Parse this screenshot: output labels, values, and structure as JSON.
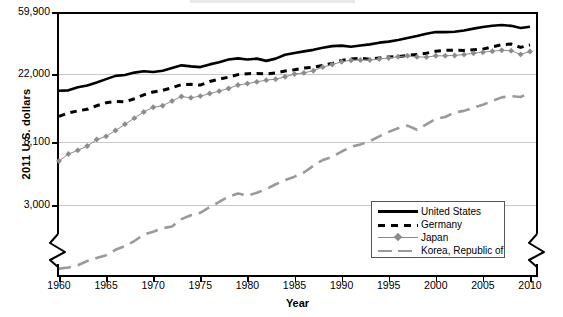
{
  "chart_data": {
    "type": "line",
    "title": "",
    "xlabel": "Year",
    "ylabel": "2011 U.S. dollars",
    "yscale": "log",
    "ylim": [
      1000,
      59900
    ],
    "xlim": [
      1960,
      2010
    ],
    "grid": true,
    "axis_break": true,
    "legend_position": "bottom-right",
    "ytick_labels": [
      "59,900",
      "22,000",
      "8,100",
      "3,000"
    ],
    "ytick_values": [
      59900,
      22000,
      8100,
      3000
    ],
    "xtick_labels": [
      "1960",
      "1965",
      "1970",
      "1975",
      "1980",
      "1985",
      "1990",
      "1995",
      "2000",
      "2005",
      "2010"
    ],
    "xtick_values": [
      1960,
      1965,
      1970,
      1975,
      1980,
      1985,
      1990,
      1995,
      2000,
      2005,
      2010
    ],
    "x": [
      1960,
      1961,
      1962,
      1963,
      1964,
      1965,
      1966,
      1967,
      1968,
      1969,
      1970,
      1971,
      1972,
      1973,
      1974,
      1975,
      1976,
      1977,
      1978,
      1979,
      1980,
      1981,
      1982,
      1983,
      1984,
      1985,
      1986,
      1987,
      1988,
      1989,
      1990,
      1991,
      1992,
      1993,
      1994,
      1995,
      1996,
      1997,
      1998,
      1999,
      2000,
      2001,
      2002,
      2003,
      2004,
      2005,
      2006,
      2007,
      2008,
      2009,
      2010
    ],
    "series": [
      {
        "name": "United States",
        "color": "#000000",
        "style": "solid",
        "marker": "none",
        "values": [
          17200,
          17300,
          18100,
          18600,
          19400,
          20400,
          21400,
          21700,
          22500,
          23000,
          22700,
          23200,
          24200,
          25300,
          24900,
          24600,
          25700,
          26600,
          27800,
          28300,
          27800,
          28200,
          27200,
          28200,
          30000,
          30900,
          31700,
          32500,
          33600,
          34500,
          34800,
          34200,
          34900,
          35500,
          36500,
          37100,
          38100,
          39300,
          40600,
          42100,
          43300,
          43300,
          43500,
          44400,
          45800,
          47000,
          48000,
          48500,
          47900,
          46300,
          47200
        ]
      },
      {
        "name": "Germany",
        "color": "#000000",
        "style": "dashed",
        "marker": "none",
        "values": [
          11800,
          12400,
          12800,
          13100,
          13800,
          14400,
          14700,
          14600,
          15300,
          16200,
          16900,
          17300,
          18000,
          18800,
          18900,
          18700,
          19700,
          20400,
          21000,
          21800,
          22100,
          22200,
          22000,
          22400,
          23100,
          23600,
          24200,
          24500,
          25300,
          26100,
          27400,
          28000,
          28400,
          27900,
          28500,
          29000,
          29200,
          29700,
          30200,
          30800,
          31800,
          32300,
          32300,
          32200,
          32600,
          32900,
          34100,
          35300,
          35700,
          33800,
          35200
        ]
      },
      {
        "name": "Japan",
        "color": "#8c8c8c",
        "style": "solid",
        "marker": "diamond",
        "values": [
          6000,
          6700,
          7100,
          7600,
          8400,
          8800,
          9600,
          10500,
          11500,
          12600,
          13500,
          13800,
          14800,
          15800,
          15500,
          15900,
          16500,
          17100,
          17800,
          18700,
          19100,
          19600,
          20100,
          20400,
          21100,
          22000,
          22400,
          23200,
          24600,
          25600,
          26800,
          27500,
          27600,
          27600,
          28000,
          28500,
          29100,
          29500,
          29000,
          28900,
          29500,
          29500,
          29700,
          30100,
          30800,
          31300,
          31800,
          32300,
          32000,
          30200,
          31600
        ]
      },
      {
        "name": "Korea, Republic of",
        "color": "#9a9a9a",
        "style": "dashed",
        "marker": "none",
        "values": [
          1100,
          1120,
          1160,
          1240,
          1300,
          1360,
          1480,
          1570,
          1700,
          1880,
          1970,
          2080,
          2140,
          2400,
          2550,
          2650,
          2900,
          3150,
          3420,
          3600,
          3470,
          3640,
          3850,
          4160,
          4440,
          4690,
          5010,
          5560,
          6100,
          6400,
          6970,
          7500,
          7800,
          8200,
          8800,
          9400,
          9900,
          10300,
          9700,
          10500,
          11400,
          11700,
          12500,
          12800,
          13400,
          14000,
          14800,
          15600,
          15900,
          15700,
          16700
        ]
      }
    ]
  },
  "axes": {
    "ylabel": "2011 U.S. dollars",
    "xlabel": "Year"
  },
  "legend": {
    "entries": [
      {
        "label": "United States"
      },
      {
        "label": "Germany"
      },
      {
        "label": "Japan"
      },
      {
        "label": "Korea, Republic of"
      }
    ]
  }
}
